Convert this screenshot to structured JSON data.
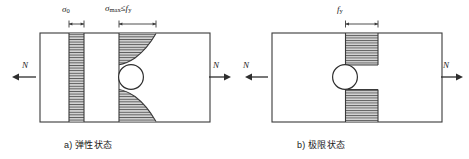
{
  "figure": {
    "type": "engineering-diagram",
    "panels": [
      {
        "id": "a",
        "caption": "a) 弹性状态",
        "caption_index": "a)",
        "caption_text": "弹性状态",
        "plate": {
          "x": 40,
          "y": 33,
          "width": 170,
          "height": 89
        },
        "hole": {
          "cx": 131,
          "cy": 77,
          "r": 12
        },
        "load_left": {
          "label": "N",
          "direction": "left"
        },
        "load_right": {
          "label": "N",
          "direction": "right"
        },
        "dimensions": [
          {
            "name": "sigma-0",
            "label": "σ0",
            "symbol": "σ",
            "subscript": "0",
            "x1": 69,
            "x2": 84,
            "y": 24
          },
          {
            "name": "sigma-max",
            "label": "σmax ≤ fy",
            "symbol": "σ",
            "subscript": "max",
            "relation": "≤",
            "limit": "fy",
            "x1": 119,
            "x2": 156,
            "y": 24
          }
        ],
        "stress_blocks": [
          {
            "name": "uniform-stress-block",
            "shape": "rectangle",
            "x": 69,
            "y": 33,
            "width": 15,
            "height": 89,
            "stress": "σ0"
          },
          {
            "name": "concentration-curve-upper",
            "shape": "hyperbolic",
            "baseline_x": 119,
            "max_x": 156,
            "y_top": 33,
            "y_bottom": 65,
            "stress": "σmax"
          },
          {
            "name": "concentration-curve-lower",
            "shape": "hyperbolic",
            "baseline_x": 119,
            "max_x": 156,
            "y_top": 89,
            "y_bottom": 122,
            "stress": "σmax"
          }
        ]
      },
      {
        "id": "b",
        "caption": "b) 极限状态",
        "caption_index": "b)",
        "caption_text": "极限状态",
        "plate": {
          "x": 272,
          "y": 33,
          "width": 170,
          "height": 89
        },
        "hole": {
          "cx": 345,
          "cy": 77,
          "r": 12
        },
        "load_left": {
          "label": "N",
          "direction": "left"
        },
        "load_right": {
          "label": "N",
          "direction": "right"
        },
        "dimensions": [
          {
            "name": "f-y",
            "label": "fy",
            "symbol": "f",
            "subscript": "y",
            "x1": 345,
            "x2": 378,
            "y": 24
          }
        ],
        "stress_blocks": [
          {
            "name": "yield-block-upper",
            "shape": "rectangle",
            "x": 345,
            "y": 33,
            "width": 33,
            "height": 32,
            "stress": "fy"
          },
          {
            "name": "yield-block-lower",
            "shape": "rectangle",
            "x": 345,
            "y": 89,
            "width": 33,
            "height": 33,
            "stress": "fy"
          }
        ]
      }
    ],
    "load_arrows": [
      {
        "name": "load-arrow-far-left",
        "label": "N",
        "direction": "left",
        "x1": 36,
        "x2": 12,
        "y": 77
      },
      {
        "name": "load-arrow-mid-left",
        "label": "N",
        "direction": "right",
        "x1": 208,
        "x2": 231,
        "y": 77
      },
      {
        "name": "load-arrow-mid-right",
        "label": "N",
        "direction": "left",
        "x1": 268,
        "x2": 245,
        "y": 77
      },
      {
        "name": "load-arrow-far-right",
        "label": "N",
        "direction": "right",
        "x1": 440,
        "x2": 463,
        "y": 77
      }
    ],
    "colors": {
      "outline": "#3a3a3a",
      "hatch": "#4a4a4a",
      "hatch_fill": "#cfcfcf",
      "text": "#1a1a1a",
      "background": "#ffffff"
    }
  }
}
